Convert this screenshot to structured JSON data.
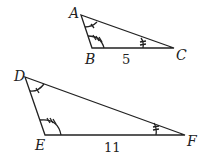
{
  "diagram": {
    "triangle1": {
      "vertices": {
        "A": "A",
        "B": "B",
        "C": "C"
      },
      "side_label_BC": "5",
      "angle_marks": {
        "A": "single arc with 1 tick",
        "B": "single arc with 3 ticks",
        "C": "single arc with 2 ticks"
      }
    },
    "triangle2": {
      "vertices": {
        "D": "D",
        "E": "E",
        "F": "F"
      },
      "side_label_EF": "11",
      "angle_marks": {
        "D": "single arc with 1 tick",
        "E": "single arc with 3 ticks",
        "F": "single arc with 2 ticks"
      }
    },
    "colors": {
      "stroke": "#222222",
      "background": "#ffffff"
    }
  }
}
